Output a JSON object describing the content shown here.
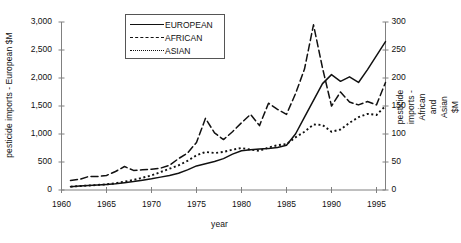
{
  "chart_data": {
    "type": "line",
    "title": "",
    "xlabel": "year",
    "ylabel": "pesticide imports - European $M",
    "ylabel_right": "pesticide imports - African and Asian $M",
    "xlim": [
      1960,
      1996
    ],
    "ylim": [
      0,
      3000
    ],
    "ylim_right": [
      0,
      300
    ],
    "grid": false,
    "legend_position": "top-center",
    "xticks": [
      1960,
      1965,
      1970,
      1975,
      1980,
      1985,
      1990,
      1995
    ],
    "xtick_labels": [
      "1960",
      "1965",
      "1970",
      "1975",
      "1980",
      "1985",
      "1990",
      "1995"
    ],
    "yticks": [
      0,
      500,
      1000,
      1500,
      2000,
      2500,
      3000
    ],
    "ytick_labels": [
      "0",
      "500",
      "1,000",
      "1,500",
      "2,000",
      "2,500",
      "3,000"
    ],
    "yticks_right": [
      0,
      50,
      100,
      150,
      200,
      250,
      300
    ],
    "ytick_labels_right": [
      "0",
      "50",
      "100",
      "150",
      "200",
      "250",
      "300"
    ],
    "x": [
      1961,
      1962,
      1963,
      1964,
      1965,
      1966,
      1967,
      1968,
      1969,
      1970,
      1971,
      1972,
      1973,
      1974,
      1975,
      1976,
      1977,
      1978,
      1979,
      1980,
      1981,
      1982,
      1983,
      1984,
      1985,
      1986,
      1987,
      1988,
      1989,
      1990,
      1991,
      1992,
      1993,
      1994,
      1995,
      1996
    ],
    "series": [
      {
        "name": "EUROPEAN",
        "axis": "left",
        "style": "solid",
        "units": "$M",
        "values": [
          60,
          70,
          80,
          90,
          100,
          110,
          130,
          150,
          175,
          200,
          230,
          260,
          300,
          360,
          430,
          470,
          510,
          560,
          640,
          700,
          720,
          730,
          740,
          760,
          800,
          1000,
          1300,
          1600,
          1900,
          2060,
          1940,
          2020,
          1920,
          2150,
          2400,
          2650
        ]
      },
      {
        "name": "AFRICAN",
        "axis": "right",
        "style": "dashed",
        "units": "$M",
        "values": [
          17,
          19,
          24,
          24,
          26,
          33,
          42,
          35,
          36,
          37,
          39,
          44,
          56,
          66,
          85,
          128,
          102,
          90,
          104,
          120,
          135,
          115,
          155,
          144,
          135,
          172,
          216,
          295,
          218,
          150,
          175,
          157,
          152,
          158,
          152,
          192
        ]
      },
      {
        "name": "ASIAN",
        "axis": "right",
        "style": "dotted",
        "units": "$M",
        "values": [
          6,
          7,
          8,
          9,
          10,
          12,
          15,
          18,
          22,
          26,
          32,
          38,
          44,
          52,
          62,
          68,
          66,
          68,
          72,
          75,
          72,
          70,
          76,
          80,
          82,
          94,
          104,
          117,
          116,
          104,
          108,
          120,
          130,
          136,
          134,
          150
        ]
      }
    ]
  },
  "legend": {
    "items": [
      {
        "label": "EUROPEAN",
        "key": "solid-line-key"
      },
      {
        "label": "AFRICAN",
        "key": "dashed-line-key"
      },
      {
        "label": "ASIAN",
        "key": "dotted-line-key"
      }
    ]
  },
  "colors": {
    "line": "#111111",
    "axis": "#808080",
    "text": "#111111",
    "background": "#ffffff"
  }
}
